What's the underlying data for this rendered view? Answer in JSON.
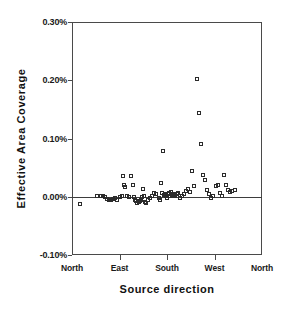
{
  "chart_data": {
    "type": "scatter",
    "title": "",
    "xlabel": "Source direction",
    "ylabel": "Effective Area  Coverage",
    "ylim": [
      -0.1,
      0.3
    ],
    "xlim": [
      0,
      360
    ],
    "grid": false,
    "legend": null,
    "marker": "open-square",
    "marker_color": "#2b2b2b",
    "zero_reference_line": 0.0,
    "ytick_labels": [
      "0.30%",
      "0.20%",
      "0.10%",
      "0.00%",
      "-0.10%"
    ],
    "ytick_values": [
      0.3,
      0.2,
      0.1,
      0.0,
      -0.1
    ],
    "xtick_labels": [
      "North",
      "East",
      "South",
      "West",
      "North"
    ],
    "xtick_values": [
      0,
      90,
      180,
      270,
      360
    ],
    "series": [
      {
        "name": "Effective Area Coverage by source direction",
        "x": [
          15,
          48,
          55,
          58,
          62,
          66,
          70,
          74,
          78,
          82,
          86,
          90,
          94,
          96,
          98,
          100,
          104,
          108,
          112,
          116,
          118,
          120,
          122,
          124,
          126,
          128,
          130,
          132,
          134,
          136,
          138,
          140,
          144,
          148,
          152,
          156,
          160,
          164,
          166,
          168,
          170,
          172,
          174,
          176,
          178,
          180,
          182,
          184,
          186,
          188,
          190,
          192,
          194,
          196,
          198,
          200,
          204,
          208,
          212,
          216,
          220,
          224,
          228,
          232,
          236,
          240,
          244,
          248,
          252,
          256,
          260,
          264,
          268,
          272,
          276,
          280,
          284,
          288,
          292,
          296,
          300,
          304,
          308
        ],
        "y": [
          -0.012,
          0.002,
          0.002,
          0.001,
          0.0,
          -0.004,
          -0.006,
          -0.005,
          -0.004,
          -0.002,
          -0.005,
          0.0,
          0.002,
          0.036,
          0.02,
          0.017,
          0.001,
          -0.001,
          0.036,
          0.02,
          0.0,
          -0.005,
          -0.007,
          -0.01,
          -0.009,
          -0.008,
          -0.006,
          0.0,
          0.013,
          0.001,
          -0.009,
          -0.01,
          -0.005,
          -0.003,
          0.001,
          0.006,
          0.004,
          -0.002,
          -0.005,
          0.023,
          0.006,
          0.078,
          0.003,
          0.005,
          0.001,
          -0.002,
          0.004,
          0.006,
          0.002,
          0.008,
          0.002,
          0.005,
          0.003,
          0.001,
          0.004,
          0.006,
          -0.002,
          0.001,
          0.004,
          0.01,
          0.014,
          0.008,
          0.044,
          0.018,
          0.202,
          0.143,
          0.091,
          0.037,
          0.028,
          0.012,
          0.005,
          -0.002,
          0.001,
          0.018,
          0.021,
          0.007,
          0.002,
          0.037,
          0.02,
          0.012,
          0.008,
          0.01,
          0.011
        ]
      }
    ]
  },
  "axes": {
    "y_title": "Effective Area  Coverage",
    "x_title": "Source  direction"
  }
}
